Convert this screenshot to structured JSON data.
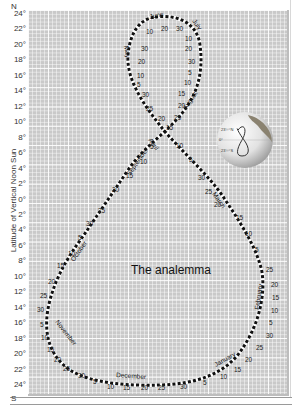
{
  "title": "The analemma",
  "y_axis": {
    "label": "Latitude of Vertical Noon Sun",
    "north_label": "N",
    "south_label": "S",
    "ticks": [
      {
        "label": "24°",
        "lat": 24
      },
      {
        "label": "22°",
        "lat": 22
      },
      {
        "label": "20°",
        "lat": 20
      },
      {
        "label": "18°",
        "lat": 18
      },
      {
        "label": "16°",
        "lat": 16
      },
      {
        "label": "14°",
        "lat": 14
      },
      {
        "label": "12°",
        "lat": 12
      },
      {
        "label": "10°",
        "lat": 10
      },
      {
        "label": "8°",
        "lat": 8
      },
      {
        "label": "6°",
        "lat": 6
      },
      {
        "label": "4°",
        "lat": 4
      },
      {
        "label": "2°",
        "lat": 2
      },
      {
        "label": "0°",
        "lat": 0
      },
      {
        "label": "2°",
        "lat": -2
      },
      {
        "label": "4°",
        "lat": -4
      },
      {
        "label": "6°",
        "lat": -6
      },
      {
        "label": "8°",
        "lat": -8
      },
      {
        "label": "10°",
        "lat": -10
      },
      {
        "label": "12°",
        "lat": -12
      },
      {
        "label": "14°",
        "lat": -14
      },
      {
        "label": "16°",
        "lat": -16
      },
      {
        "label": "18°",
        "lat": -18
      },
      {
        "label": "20°",
        "lat": -20
      },
      {
        "label": "22°",
        "lat": -22
      },
      {
        "label": "24°",
        "lat": -24
      }
    ]
  },
  "months": [
    "June",
    "July",
    "August",
    "September",
    "October",
    "November",
    "December",
    "January",
    "February",
    "March",
    "April",
    "May"
  ],
  "globe": {
    "label_top": "23½°N",
    "label_bottom": "23½°S",
    "label_mid": "0°"
  },
  "colors": {
    "plot_bg": "#c9c9c9",
    "grid": "#ffffff",
    "curve": "#111111"
  },
  "chart_data": {
    "type": "line",
    "title": "The analemma",
    "xlabel": "",
    "ylabel": "Latitude of Vertical Noon Sun",
    "ylim": [
      -24,
      24
    ],
    "grid": true,
    "series": [
      {
        "name": "Analemma (sun declination through the year)",
        "points": [
          {
            "date": "Jun 21",
            "lat": 23.4
          },
          {
            "date": "Jul 1",
            "lat": 23.1
          },
          {
            "date": "Jul 10",
            "lat": 22.3
          },
          {
            "date": "Jul 20",
            "lat": 20.7
          },
          {
            "date": "Jul 30",
            "lat": 18.6
          },
          {
            "date": "Aug 5",
            "lat": 17.0
          },
          {
            "date": "Aug 10",
            "lat": 15.7
          },
          {
            "date": "Aug 15",
            "lat": 14.2
          },
          {
            "date": "Aug 20",
            "lat": 12.6
          },
          {
            "date": "Aug 25",
            "lat": 11.0
          },
          {
            "date": "Aug 30",
            "lat": 9.2
          },
          {
            "date": "Sep 5",
            "lat": 7.0
          },
          {
            "date": "Sep 10",
            "lat": 5.1
          },
          {
            "date": "Sep 15",
            "lat": 3.2
          },
          {
            "date": "Sep 20",
            "lat": 1.3
          },
          {
            "date": "Sep 25",
            "lat": -0.7
          },
          {
            "date": "Sep 30",
            "lat": -2.6
          },
          {
            "date": "Oct 5",
            "lat": -4.6
          },
          {
            "date": "Oct 10",
            "lat": -6.5
          },
          {
            "date": "Oct 15",
            "lat": -8.4
          },
          {
            "date": "Oct 20",
            "lat": -10.2
          },
          {
            "date": "Oct 25",
            "lat": -11.9
          },
          {
            "date": "Oct 30",
            "lat": -13.6
          },
          {
            "date": "Nov 5",
            "lat": -15.5
          },
          {
            "date": "Nov 10",
            "lat": -16.9
          },
          {
            "date": "Nov 15",
            "lat": -18.3
          },
          {
            "date": "Nov 20",
            "lat": -19.6
          },
          {
            "date": "Nov 25",
            "lat": -20.7
          },
          {
            "date": "Nov 30",
            "lat": -21.6
          },
          {
            "date": "Dec 5",
            "lat": -22.4
          },
          {
            "date": "Dec 10",
            "lat": -22.9
          },
          {
            "date": "Dec 15",
            "lat": -23.3
          },
          {
            "date": "Dec 20",
            "lat": -23.4
          },
          {
            "date": "Dec 25",
            "lat": -23.4
          },
          {
            "date": "Dec 30",
            "lat": -23.2
          },
          {
            "date": "Jan 5",
            "lat": -22.7
          },
          {
            "date": "Jan 10",
            "lat": -22.0
          },
          {
            "date": "Jan 15",
            "lat": -21.2
          },
          {
            "date": "Jan 20",
            "lat": -20.2
          },
          {
            "date": "Jan 25",
            "lat": -19.1
          },
          {
            "date": "Jan 30",
            "lat": -17.9
          },
          {
            "date": "Feb 5",
            "lat": -16.2
          },
          {
            "date": "Feb 10",
            "lat": -14.7
          },
          {
            "date": "Feb 15",
            "lat": -13.0
          },
          {
            "date": "Feb 20",
            "lat": -11.3
          },
          {
            "date": "Feb 25",
            "lat": -9.5
          },
          {
            "date": "Mar 5",
            "lat": -6.4
          },
          {
            "date": "Mar 10",
            "lat": -4.4
          },
          {
            "date": "Mar 15",
            "lat": -2.5
          },
          {
            "date": "Mar 20",
            "lat": -0.5
          },
          {
            "date": "Mar 25",
            "lat": 1.5
          },
          {
            "date": "Mar 30",
            "lat": 3.5
          },
          {
            "date": "Apr 5",
            "lat": 5.8
          },
          {
            "date": "Apr 10",
            "lat": 7.7
          },
          {
            "date": "Apr 15",
            "lat": 9.6
          },
          {
            "date": "Apr 20",
            "lat": 11.4
          },
          {
            "date": "Apr 25",
            "lat": 13.1
          },
          {
            "date": "Apr 30",
            "lat": 14.7
          },
          {
            "date": "May 5",
            "lat": 16.2
          },
          {
            "date": "May 10",
            "lat": 17.6
          },
          {
            "date": "May 20",
            "lat": 20.0
          },
          {
            "date": "May 30",
            "lat": 21.8
          },
          {
            "date": "Jun 10",
            "lat": 23.0
          },
          {
            "date": "Jun 21",
            "lat": 23.4
          }
        ]
      }
    ],
    "annotations": [
      "June",
      "July",
      "August",
      "September",
      "October",
      "November",
      "December",
      "January",
      "February",
      "March",
      "April",
      "May",
      "The analemma"
    ],
    "day_labels": [
      "5",
      "10",
      "15",
      "20",
      "25",
      "30"
    ]
  }
}
